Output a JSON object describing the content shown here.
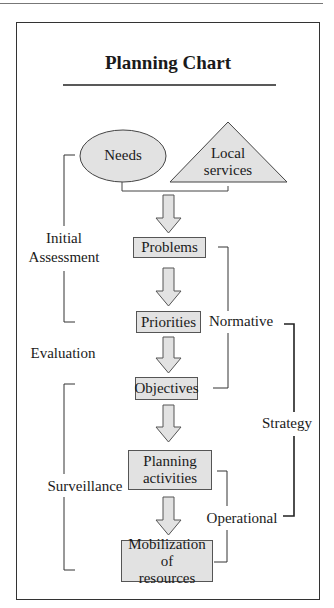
{
  "title": "Planning Chart",
  "inputs": {
    "needs": "Needs",
    "local_services_line1": "Local",
    "local_services_line2": "services"
  },
  "steps": [
    {
      "label": "Problems"
    },
    {
      "label": "Priorities"
    },
    {
      "label": "Objectives"
    },
    {
      "label_line1": "Planning",
      "label_line2": "activities"
    },
    {
      "label_line1": "Mobilization of",
      "label_line2": "resources"
    }
  ],
  "brackets": {
    "initial_assessment_line1": "Initial",
    "initial_assessment_line2": "Assessment",
    "evaluation": "Evaluation",
    "surveillance": "Surveillance",
    "normative": "Normative",
    "strategy": "Strategy",
    "operational": "Operational"
  },
  "colors": {
    "shape_fill": "#e2e2e2",
    "line": "#333333"
  }
}
